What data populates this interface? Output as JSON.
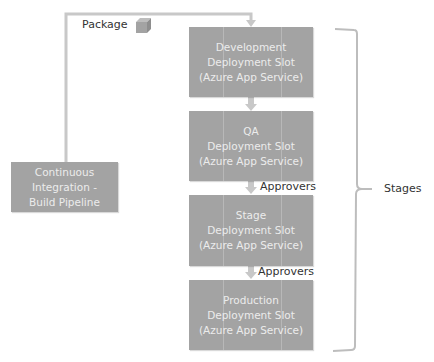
{
  "package_label": "Package",
  "ci_box": {
    "line1": "Continuous",
    "line2": "Integration -",
    "line3": "Build Pipeline"
  },
  "slots": [
    {
      "line1": "Development",
      "line2": "Deployment Slot",
      "line3": "(Azure App Service)"
    },
    {
      "line1": "QA",
      "line2": "Deployment Slot",
      "line3": "(Azure App Service)"
    },
    {
      "line1": "Stage",
      "line2": "Deployment Slot",
      "line3": "(Azure App Service)"
    },
    {
      "line1": "Production",
      "line2": "Deployment Slot",
      "line3": "(Azure App Service)"
    }
  ],
  "approvers": [
    "Approvers",
    "Approvers"
  ],
  "stages_label": "Stages",
  "colors": {
    "box": "#a3a3a3",
    "connector": "#c8c8c8",
    "text_light": "#ececec"
  }
}
